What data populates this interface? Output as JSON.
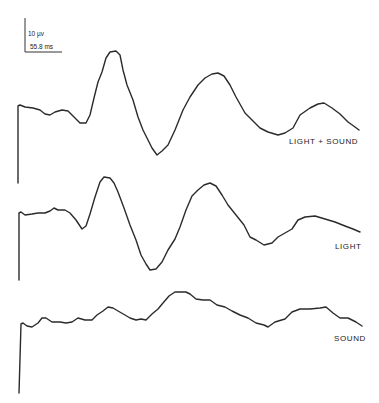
{
  "scale_bar": {
    "voltage_label": "10 µv",
    "time_label": "55.8 ms"
  },
  "chart_data": {
    "type": "line",
    "title": "",
    "xlabel": "",
    "ylabel": "",
    "grid": false,
    "legend": "inline labels at right of each trace",
    "scale_bar": {
      "voltage": "10 µV",
      "time": "55.8 ms"
    },
    "series": [
      {
        "name": "LIGHT + SOUND",
        "description": "Evoked potential trace; initial stimulus artifact, small dip, large positive peak, deep trough, second broad peak, trough, smaller third peak",
        "points_px": [
          [
            18,
            183
          ],
          [
            18,
            106
          ],
          [
            20,
            105
          ],
          [
            25,
            107
          ],
          [
            33,
            108
          ],
          [
            40,
            110
          ],
          [
            45,
            114
          ],
          [
            50,
            115
          ],
          [
            55,
            112
          ],
          [
            62,
            110
          ],
          [
            68,
            111
          ],
          [
            74,
            117
          ],
          [
            80,
            123
          ],
          [
            86,
            123
          ],
          [
            90,
            115
          ],
          [
            94,
            98
          ],
          [
            98,
            82
          ],
          [
            102,
            72
          ],
          [
            106,
            58
          ],
          [
            110,
            52
          ],
          [
            116,
            51
          ],
          [
            120,
            55
          ],
          [
            123,
            70
          ],
          [
            127,
            85
          ],
          [
            133,
            100
          ],
          [
            138,
            117
          ],
          [
            143,
            130
          ],
          [
            148,
            140
          ],
          [
            152,
            148
          ],
          [
            157,
            155
          ],
          [
            162,
            151
          ],
          [
            168,
            145
          ],
          [
            175,
            130
          ],
          [
            183,
            110
          ],
          [
            190,
            97
          ],
          [
            198,
            85
          ],
          [
            205,
            78
          ],
          [
            212,
            74
          ],
          [
            218,
            73
          ],
          [
            224,
            76
          ],
          [
            230,
            85
          ],
          [
            236,
            97
          ],
          [
            245,
            113
          ],
          [
            252,
            120
          ],
          [
            260,
            128
          ],
          [
            268,
            132
          ],
          [
            278,
            135
          ],
          [
            285,
            133
          ],
          [
            293,
            128
          ],
          [
            300,
            115
          ],
          [
            310,
            108
          ],
          [
            318,
            104
          ],
          [
            324,
            103
          ],
          [
            332,
            108
          ],
          [
            340,
            114
          ],
          [
            348,
            122
          ],
          [
            355,
            127
          ],
          [
            359,
            130
          ]
        ]
      },
      {
        "name": "LIGHT",
        "description": "Evoked potential trace; similar morphology to LIGHT + SOUND with slightly smaller amplitudes",
        "points_px": [
          [
            19,
            280
          ],
          [
            19,
            213
          ],
          [
            21,
            212
          ],
          [
            25,
            215
          ],
          [
            32,
            214
          ],
          [
            38,
            213
          ],
          [
            45,
            213
          ],
          [
            50,
            211
          ],
          [
            54,
            208
          ],
          [
            58,
            210
          ],
          [
            65,
            210
          ],
          [
            70,
            213
          ],
          [
            76,
            220
          ],
          [
            82,
            229
          ],
          [
            86,
            226
          ],
          [
            90,
            214
          ],
          [
            95,
            197
          ],
          [
            100,
            182
          ],
          [
            104,
            177
          ],
          [
            110,
            178
          ],
          [
            114,
            183
          ],
          [
            118,
            192
          ],
          [
            124,
            208
          ],
          [
            130,
            225
          ],
          [
            136,
            240
          ],
          [
            141,
            255
          ],
          [
            146,
            264
          ],
          [
            150,
            270
          ],
          [
            156,
            269
          ],
          [
            162,
            262
          ],
          [
            168,
            250
          ],
          [
            175,
            239
          ],
          [
            180,
            227
          ],
          [
            186,
            210
          ],
          [
            192,
            196
          ],
          [
            198,
            190
          ],
          [
            204,
            185
          ],
          [
            210,
            183
          ],
          [
            216,
            186
          ],
          [
            222,
            195
          ],
          [
            228,
            205
          ],
          [
            236,
            215
          ],
          [
            244,
            225
          ],
          [
            250,
            237
          ],
          [
            256,
            240
          ],
          [
            264,
            245
          ],
          [
            272,
            243
          ],
          [
            278,
            237
          ],
          [
            285,
            233
          ],
          [
            292,
            229
          ],
          [
            298,
            220
          ],
          [
            305,
            217
          ],
          [
            315,
            216
          ],
          [
            325,
            219
          ],
          [
            335,
            222
          ],
          [
            345,
            226
          ],
          [
            353,
            229
          ],
          [
            360,
            232
          ]
        ]
      },
      {
        "name": "SOUND",
        "description": "Evoked potential trace; low amplitude, gradual rise to broad peak then trough and small late peak",
        "points_px": [
          [
            19,
            393
          ],
          [
            21,
            324
          ],
          [
            23,
            323
          ],
          [
            27,
            326
          ],
          [
            32,
            327
          ],
          [
            38,
            323
          ],
          [
            42,
            318
          ],
          [
            46,
            318
          ],
          [
            52,
            322
          ],
          [
            60,
            322
          ],
          [
            66,
            323
          ],
          [
            72,
            322
          ],
          [
            78,
            318
          ],
          [
            85,
            320
          ],
          [
            92,
            320
          ],
          [
            97,
            315
          ],
          [
            103,
            311
          ],
          [
            108,
            307
          ],
          [
            113,
            308
          ],
          [
            118,
            311
          ],
          [
            125,
            315
          ],
          [
            130,
            318
          ],
          [
            136,
            320
          ],
          [
            141,
            319
          ],
          [
            146,
            320
          ],
          [
            152,
            314
          ],
          [
            158,
            309
          ],
          [
            163,
            303
          ],
          [
            169,
            296
          ],
          [
            175,
            292
          ],
          [
            180,
            292
          ],
          [
            186,
            292
          ],
          [
            190,
            294
          ],
          [
            196,
            299
          ],
          [
            203,
            300
          ],
          [
            210,
            300
          ],
          [
            217,
            305
          ],
          [
            225,
            307
          ],
          [
            232,
            311
          ],
          [
            240,
            315
          ],
          [
            248,
            318
          ],
          [
            256,
            323
          ],
          [
            264,
            325
          ],
          [
            268,
            327
          ],
          [
            275,
            322
          ],
          [
            285,
            319
          ],
          [
            292,
            312
          ],
          [
            300,
            309
          ],
          [
            310,
            309
          ],
          [
            320,
            308
          ],
          [
            326,
            307
          ],
          [
            333,
            313
          ],
          [
            340,
            318
          ],
          [
            348,
            318
          ],
          [
            356,
            322
          ],
          [
            362,
            326
          ]
        ]
      }
    ],
    "annotations": [
      "LIGHT + SOUND",
      "LIGHT",
      "SOUND",
      "10 µv",
      "55.8 ms"
    ]
  },
  "labels": {
    "trace1": "LIGHT + SOUND",
    "trace2": "LIGHT",
    "trace3": "SOUND"
  }
}
